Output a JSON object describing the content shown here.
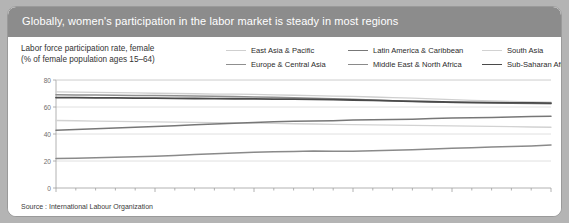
{
  "header": {
    "title": "Globally, women's participation in the labor market is steady in most regions"
  },
  "source": "Source : International Labour Organization",
  "colors": {
    "header_band": "#8c8c8c",
    "outer_background": "#b4b4b4",
    "panel_background": "#ffffff",
    "panel_border": "#9a9a9a",
    "axis": "#9e9e9e",
    "text": "#2b2b2b"
  },
  "chart_data": {
    "type": "line",
    "title": "Labor force participation rate, female (% of female population ages 15–64)",
    "ylabel_line1": "Labor force participation rate, female",
    "ylabel_line2": "(% of female population ages 15–64)",
    "xlabel": "",
    "xlim": [
      1980,
      2005
    ],
    "ylim": [
      0,
      80
    ],
    "yticks": [
      0,
      20,
      40,
      60,
      80
    ],
    "ytick_labels": [
      "0",
      "20",
      "40",
      "60",
      "80"
    ],
    "xticks": [
      1980,
      1985,
      1990,
      1995,
      2000,
      2005
    ],
    "xtick_labels": [
      "1980",
      "1985",
      "1990",
      "1995",
      "2000",
      "2005"
    ],
    "minor_xticks_every": 1,
    "grid": true,
    "grid_axis": "y",
    "legend_position": "top-right",
    "x": [
      1980,
      1981,
      1982,
      1983,
      1984,
      1985,
      1986,
      1987,
      1988,
      1989,
      1990,
      1991,
      1992,
      1993,
      1994,
      1995,
      1996,
      1997,
      1998,
      1999,
      2000,
      2001,
      2002,
      2003,
      2004,
      2005
    ],
    "series": [
      {
        "name": "East Asia & Pacific",
        "color": "#cfcfcf",
        "width": 1.3,
        "values": [
          71.2,
          71.0,
          70.8,
          70.6,
          70.4,
          70.2,
          70.0,
          69.8,
          69.6,
          69.5,
          69.3,
          69.0,
          68.7,
          68.4,
          68.1,
          67.8,
          67.4,
          67.0,
          66.5,
          66.0,
          65.4,
          64.9,
          64.5,
          64.1,
          63.8,
          63.6
        ]
      },
      {
        "name": "Europe & Central Asia",
        "color": "#8f8f8f",
        "width": 1.5,
        "values": [
          69.0,
          68.9,
          68.8,
          68.7,
          68.6,
          68.5,
          68.3,
          68.1,
          67.9,
          67.7,
          67.5,
          67.2,
          66.9,
          66.5,
          66.1,
          65.7,
          65.2,
          64.7,
          64.2,
          63.8,
          63.4,
          63.1,
          62.9,
          62.7,
          62.6,
          62.5
        ]
      },
      {
        "name": "Latin America & Caribbean",
        "color": "#777777",
        "width": 1.5,
        "values": [
          42.8,
          43.3,
          43.8,
          44.4,
          45.0,
          45.6,
          46.2,
          46.8,
          47.4,
          48.0,
          48.6,
          49.1,
          49.5,
          49.7,
          49.9,
          50.4,
          50.6,
          50.7,
          50.9,
          51.4,
          51.9,
          52.1,
          52.3,
          52.6,
          52.9,
          53.2
        ]
      },
      {
        "name": "Middle East & North Africa",
        "color": "#8a8a8a",
        "width": 1.5,
        "values": [
          21.9,
          22.1,
          22.4,
          22.7,
          23.1,
          23.5,
          24.1,
          24.8,
          25.4,
          26.0,
          26.5,
          26.9,
          27.1,
          27.4,
          27.2,
          27.3,
          27.6,
          28.0,
          28.4,
          28.9,
          29.5,
          29.9,
          30.3,
          30.7,
          31.2,
          31.8
        ]
      },
      {
        "name": "South Asia",
        "color": "#d2d2d2",
        "width": 1.3,
        "values": [
          50.0,
          49.8,
          49.6,
          49.4,
          49.2,
          49.0,
          48.8,
          48.6,
          48.4,
          48.2,
          48.0,
          47.8,
          47.6,
          47.4,
          47.2,
          47.0,
          46.8,
          46.6,
          46.4,
          46.2,
          46.0,
          45.8,
          45.6,
          45.4,
          45.2,
          45.0
        ]
      },
      {
        "name": "Sub-Saharan Africa",
        "color": "#4a4a4a",
        "width": 1.8,
        "values": [
          67.0,
          66.9,
          66.8,
          66.7,
          66.6,
          66.5,
          66.4,
          66.3,
          66.2,
          66.1,
          66.0,
          65.9,
          65.8,
          65.6,
          65.4,
          65.2,
          64.9,
          64.6,
          64.2,
          63.9,
          63.6,
          63.4,
          63.2,
          63.1,
          63.0,
          62.9
        ]
      }
    ]
  }
}
